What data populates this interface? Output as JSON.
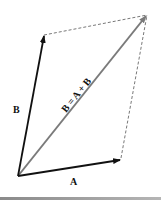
{
  "diagram": {
    "vectors": [
      {
        "id": "A",
        "label": "A",
        "from": [
          18,
          176
        ],
        "to": [
          120,
          160
        ],
        "color": "#111111"
      },
      {
        "id": "B",
        "label": "B",
        "from": [
          18,
          176
        ],
        "to": [
          44,
          35
        ],
        "color": "#111111"
      },
      {
        "id": "R",
        "label": "B = A + B",
        "from": [
          18,
          176
        ],
        "to": [
          147,
          15
        ],
        "color": "#7a7a7a"
      }
    ],
    "dashed_edges": [
      {
        "from": [
          44,
          35
        ],
        "to": [
          147,
          15
        ]
      },
      {
        "from": [
          120,
          160
        ],
        "to": [
          147,
          15
        ]
      }
    ],
    "labels": {
      "a": "A",
      "b": "B",
      "resultant": "B = A + B"
    }
  }
}
